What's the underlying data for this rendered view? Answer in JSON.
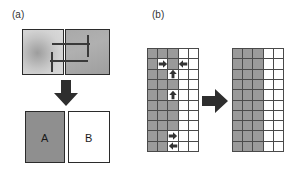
{
  "figure": {
    "background": "#ffffff",
    "ink": "#1a1a1a",
    "fill_gray": "#9a9a9a",
    "line_gray": "#4a4a4a"
  },
  "panels": {
    "a": {
      "label": "(a)",
      "top_images": {
        "left": {
          "name": "source-image",
          "style": "radial-gradient-gray"
        },
        "right": {
          "name": "target-image",
          "style": "flat-gray"
        }
      },
      "overlay": {
        "name": "registration-crosshairs",
        "lines": 4
      },
      "transform_arrow": "down-arrow",
      "results": [
        {
          "letter": "A",
          "fill": "#8f8f8f"
        },
        {
          "letter": "B",
          "fill": "#ffffff"
        }
      ]
    },
    "b": {
      "label": "(b)",
      "transform_arrow": "right-arrow",
      "left_grid": {
        "name": "annotated-grid",
        "columns": 5,
        "rows": 10,
        "filled_cells": [
          [
            0,
            0
          ],
          [
            0,
            1
          ],
          [
            0,
            2
          ],
          [
            1,
            0
          ],
          [
            1,
            1
          ],
          [
            1,
            2
          ],
          [
            2,
            0
          ],
          [
            2,
            1
          ],
          [
            2,
            2
          ],
          [
            3,
            0
          ],
          [
            3,
            1
          ],
          [
            3,
            2
          ],
          [
            4,
            0
          ],
          [
            4,
            1
          ],
          [
            4,
            2
          ],
          [
            5,
            0
          ],
          [
            5,
            1
          ],
          [
            5,
            2
          ],
          [
            6,
            0
          ],
          [
            6,
            1
          ],
          [
            6,
            2
          ],
          [
            7,
            0
          ],
          [
            7,
            1
          ],
          [
            7,
            2
          ],
          [
            8,
            0
          ],
          [
            8,
            1
          ],
          [
            8,
            2
          ],
          [
            9,
            0
          ],
          [
            9,
            1
          ],
          [
            9,
            2
          ]
        ],
        "cleared_cells": [
          [
            1,
            1
          ],
          [
            1,
            3
          ],
          [
            2,
            2
          ],
          [
            4,
            2
          ],
          [
            8,
            2
          ],
          [
            9,
            2
          ]
        ],
        "markers": [
          {
            "row": 1,
            "col": 1,
            "dir": "right"
          },
          {
            "row": 1,
            "col": 3,
            "dir": "left"
          },
          {
            "row": 2,
            "col": 2,
            "dir": "up"
          },
          {
            "row": 4,
            "col": 2,
            "dir": "up"
          },
          {
            "row": 8,
            "col": 2,
            "dir": "right"
          },
          {
            "row": 9,
            "col": 2,
            "dir": "left"
          }
        ]
      },
      "right_grid": {
        "name": "corrected-grid",
        "columns": 5,
        "rows": 10,
        "filled_columns": [
          0,
          1,
          2
        ]
      }
    }
  }
}
